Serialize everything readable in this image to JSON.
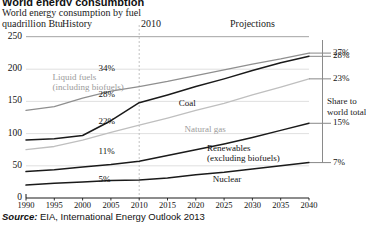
{
  "title_cropped": "World energy consumption",
  "subtitle": "World energy consumption by fuel",
  "units": "quadrillion Btu",
  "header": {
    "history": "History",
    "divider_year": "2010",
    "projections": "Projections"
  },
  "share_panel": {
    "line1": "Share to",
    "line2": "world total"
  },
  "source": {
    "prefix": "Source:",
    "text": " EIA, International Energy Outlook 2013"
  },
  "colors": {
    "coal": "#1a1a1a",
    "nuclear": "#1a1a1a",
    "renewables": "#1a1a1a",
    "liquid_fuels": "#8f8f8f",
    "natural_gas": "#bfbfbf",
    "grid": "#d8d8d8",
    "axis": "#1a1a1a",
    "divider": "#bbbbbb"
  },
  "chart_data": {
    "type": "line",
    "title": "World energy consumption by fuel",
    "xlabel": "",
    "ylabel": "quadrillion Btu",
    "xlim": [
      1990,
      2040
    ],
    "ylim": [
      0,
      250
    ],
    "yticks": [
      0,
      50,
      100,
      150,
      200,
      250
    ],
    "xticks": [
      1990,
      1995,
      2000,
      2005,
      2010,
      2015,
      2020,
      2025,
      2030,
      2035,
      2040
    ],
    "grid": true,
    "legend": "inline-labels",
    "divider_x": 2010,
    "x": [
      1990,
      1995,
      2000,
      2005,
      2010,
      2015,
      2020,
      2025,
      2030,
      2035,
      2040
    ],
    "series": [
      {
        "name": "Liquid fuels (including biofuels)",
        "color": "#8f8f8f",
        "label_x": 2000,
        "share_2010": "34%",
        "share_2040": "27%",
        "values": [
          136,
          142,
          155,
          166,
          173,
          181,
          190,
          199,
          208,
          216,
          225
        ]
      },
      {
        "name": "Coal",
        "color": "#1a1a1a",
        "label_x": 2016,
        "share_2010": "28%",
        "share_2040": "28%",
        "values": [
          90,
          92,
          97,
          120,
          148,
          160,
          173,
          185,
          198,
          210,
          220
        ]
      },
      {
        "name": "Natural gas",
        "color": "#bfbfbf",
        "label_x": 2016,
        "share_2010": "22%",
        "share_2040": "23%",
        "values": [
          75,
          80,
          90,
          102,
          113,
          124,
          136,
          147,
          160,
          172,
          185
        ]
      },
      {
        "name": "Renewables (excluding biofuels)",
        "color": "#1a1a1a",
        "label_x": 2022,
        "share_2010": "11%",
        "share_2040": "15%",
        "values": [
          41,
          44,
          48,
          52,
          57,
          66,
          75,
          84,
          94,
          105,
          116
        ]
      },
      {
        "name": "Nuclear",
        "color": "#1a1a1a",
        "label_x": 2022,
        "share_2010": "5%",
        "share_2040": "7%",
        "values": [
          20,
          23,
          25,
          27,
          28,
          31,
          36,
          40,
          45,
          50,
          55
        ]
      }
    ],
    "inline_pct_labels": [
      {
        "text": "34%",
        "x": 2000,
        "y": 200
      },
      {
        "text": "28%",
        "x": 2000,
        "y": 160
      },
      {
        "text": "22%",
        "x": 2000,
        "y": 118
      },
      {
        "text": "11%",
        "x": 2000,
        "y": 72
      },
      {
        "text": "5%",
        "x": 2000,
        "y": 28
      }
    ],
    "right_pct_labels": [
      "28%",
      "27%",
      "23%",
      "15%",
      "7%"
    ]
  }
}
